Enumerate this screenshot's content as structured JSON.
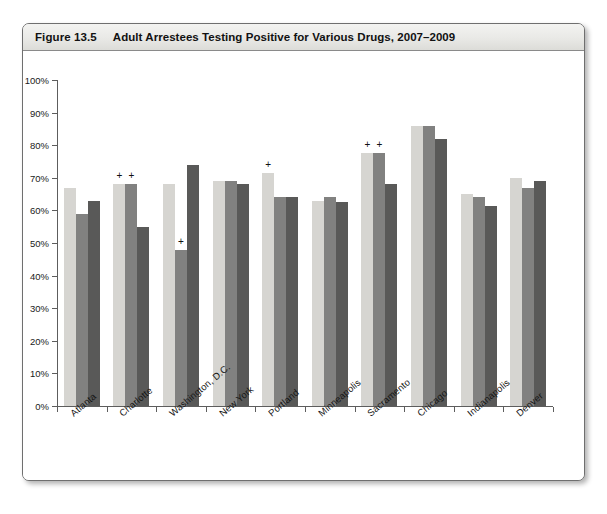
{
  "figure": {
    "number_label": "Figure 13.5",
    "title": "Adult Arrestees Testing Positive for Various Drugs, 2007–2009"
  },
  "legend": {
    "position": "bottom-center",
    "items": [
      {
        "label": "2007",
        "color": "#d6d5d1"
      },
      {
        "label": "2008",
        "color": "#818180"
      },
      {
        "label": "2009",
        "color": "#595958"
      }
    ]
  },
  "chart_data": {
    "type": "bar",
    "title": "Adult Arrestees Testing Positive for Various Drugs, 2007–2009",
    "xlabel": "",
    "ylabel": "",
    "ylim": [
      0,
      100
    ],
    "yticks": [
      0,
      10,
      20,
      30,
      40,
      50,
      60,
      70,
      80,
      90,
      100
    ],
    "ytick_labels": [
      "0%",
      "10%",
      "20%",
      "30%",
      "40%",
      "50%",
      "60%",
      "70%",
      "80%",
      "90%",
      "100%"
    ],
    "grid": false,
    "categories": [
      "Atlanta",
      "Charlotte",
      "Washington, D.C.",
      "New York",
      "Portland",
      "Minneapolis",
      "Sacramento",
      "Chicago",
      "Indianapolis",
      "Denver"
    ],
    "series": [
      {
        "name": "2007",
        "color": "#d6d5d1",
        "values": [
          67,
          68,
          68,
          69,
          71.5,
          63,
          77.5,
          86,
          65,
          70
        ]
      },
      {
        "name": "2008",
        "color": "#818180",
        "values": [
          59,
          68,
          48,
          69,
          64,
          64,
          77.5,
          86,
          64,
          67
        ]
      },
      {
        "name": "2009",
        "color": "#595958",
        "values": [
          63,
          55,
          74,
          68,
          64,
          62.5,
          68,
          82,
          61.5,
          69
        ]
      }
    ],
    "annotations": [
      {
        "symbol": "+",
        "category": "Charlotte",
        "series": "2007"
      },
      {
        "symbol": "+",
        "category": "Charlotte",
        "series": "2008"
      },
      {
        "symbol": "+",
        "category": "Washington, D.C.",
        "series": "2008"
      },
      {
        "symbol": "+",
        "category": "Portland",
        "series": "2007"
      },
      {
        "symbol": "+",
        "category": "Sacramento",
        "series": "2007"
      },
      {
        "symbol": "+",
        "category": "Sacramento",
        "series": "2008"
      }
    ]
  }
}
